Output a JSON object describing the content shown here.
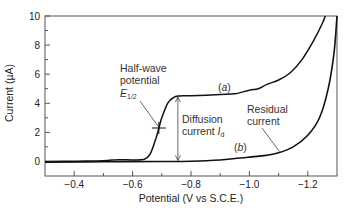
{
  "chart_data": {
    "type": "line",
    "title": "",
    "xlabel": "Potential (V vs S.C.E.)",
    "ylabel": "Current (µA)",
    "xlim": [
      -0.3,
      -1.3
    ],
    "ylim": [
      -1,
      10
    ],
    "x_ticks": [
      -0.4,
      -0.6,
      -0.8,
      -1.0,
      -1.2
    ],
    "x_tick_labels": [
      "−0.4",
      "−0.6",
      "−0.8",
      "−1.0",
      "−1.2"
    ],
    "x_minor_ticks": [
      -0.5,
      -0.7,
      -0.9,
      -1.1
    ],
    "y_ticks": [
      0,
      2,
      4,
      6,
      8,
      10
    ],
    "y_tick_labels": [
      "0",
      "2",
      "4",
      "6",
      "8",
      "10"
    ],
    "y_minor_ticks": [
      1,
      3,
      5,
      7,
      9
    ],
    "grid": false,
    "legend": null,
    "series": [
      {
        "name": "(a)",
        "description": "Polarographic wave with analyte",
        "x": [
          -0.3,
          -0.4,
          -0.5,
          -0.55,
          -0.6,
          -0.64,
          -0.66,
          -0.68,
          -0.69,
          -0.7,
          -0.72,
          -0.74,
          -0.76,
          -0.8,
          -0.9,
          -0.95,
          -1.0,
          -1.03,
          -1.06,
          -1.1,
          -1.14,
          -1.18,
          -1.22,
          -1.25,
          -1.26
        ],
        "y": [
          0.0,
          0.02,
          0.05,
          0.12,
          0.1,
          0.15,
          0.5,
          1.6,
          2.3,
          3.0,
          4.0,
          4.4,
          4.5,
          4.52,
          4.6,
          4.65,
          4.9,
          5.0,
          5.3,
          5.6,
          6.1,
          7.0,
          8.3,
          9.5,
          10.0
        ]
      },
      {
        "name": "(b)",
        "description": "Residual current (supporting electrolyte only)",
        "x": [
          -0.3,
          -0.5,
          -0.7,
          -0.8,
          -0.9,
          -0.95,
          -1.0,
          -1.05,
          -1.1,
          -1.15,
          -1.2,
          -1.24,
          -1.27,
          -1.29,
          -1.3
        ],
        "y": [
          -0.05,
          -0.02,
          0.0,
          0.02,
          0.1,
          0.2,
          0.3,
          0.4,
          0.6,
          1.0,
          1.8,
          3.0,
          5.0,
          7.5,
          10.0
        ]
      }
    ],
    "annotations": [
      {
        "text": "Half-wave potential E1/2",
        "points_to": {
          "x": -0.69,
          "y": 2.3
        },
        "marker": "cross"
      },
      {
        "text": "Diffusion current I_d",
        "type": "double-arrow",
        "x": -0.755,
        "y_from": 0.0,
        "y_to": 4.5
      },
      {
        "text": "Residual current",
        "points_to": {
          "x": -1.1,
          "y": 0.6
        }
      },
      {
        "text": "(a)",
        "near": {
          "x": -0.95,
          "y": 4.9
        }
      },
      {
        "text": "(b)",
        "near": {
          "x": -0.98,
          "y": 0.5
        }
      }
    ]
  },
  "labels": {
    "xlabel": "Potential (V vs S.C.E.)",
    "ylabel": "Current (µA)",
    "half_wave_line1": "Half-wave",
    "half_wave_line2": "potential",
    "half_wave_symbol": "E",
    "half_wave_sub": "1/2",
    "diffusion_line1": "Diffusion",
    "diffusion_line2": "current ",
    "diffusion_symbol": "I",
    "diffusion_sub": "d",
    "residual_line1": "Residual",
    "residual_line2": "current",
    "series_a": "(a)",
    "series_b": "(b)",
    "series_a_letter": "a",
    "series_b_letter": "b"
  },
  "colors": {
    "curve": "#111111",
    "axis": "#555555",
    "text": "#222222"
  }
}
